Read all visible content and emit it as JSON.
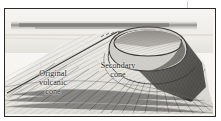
{
  "figure": {
    "kind": "pen-and-ink geological cross-section illustration",
    "frame": {
      "border_color": "#2a2a2a",
      "paper_color": "#f7f6f3"
    },
    "ink_color": "#4a4a4a",
    "shadow_color": "#6f6f6f",
    "labels": [
      {
        "id": "original-volcanic-cone",
        "lines": [
          "Original",
          "volcanic",
          "cone"
        ],
        "line1": "Original",
        "line2": "volcanic",
        "line3": "cone"
      },
      {
        "id": "secondary-cone",
        "lines": [
          "Secondary",
          "cone"
        ],
        "line1": "Secondary",
        "line2": "cone"
      }
    ],
    "features": {
      "horizon": "distant dark cloud band across upper background",
      "left_ridge": "long straight ridge line descending to lower-left",
      "crater_rim": "elliptical rim of secondary cone, light interior",
      "right_flank": "heavily cross-hatched shaded slope",
      "foreground": "radial hatch lines fanning down the outer slope"
    }
  }
}
